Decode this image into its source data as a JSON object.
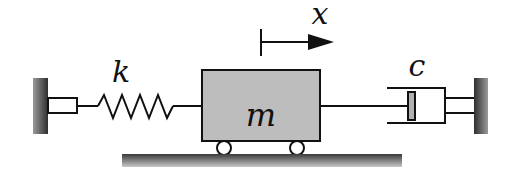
{
  "diagram": {
    "labels": {
      "displacement": "x",
      "spring_constant": "k",
      "mass": "m",
      "damping": "c"
    },
    "colors": {
      "line": "#111111",
      "mass_fill": "#bdbdbd",
      "piston_fill": "#b0b0b0",
      "wall_dark": "#3a3a3a",
      "wall_light": "#9a9a9a",
      "ground_dark": "#444444",
      "ground_light": "#bbbbbb"
    },
    "components": [
      "left-wall",
      "spring",
      "mass",
      "wheels",
      "ground",
      "displacement-arrow",
      "dashpot",
      "right-wall"
    ]
  }
}
